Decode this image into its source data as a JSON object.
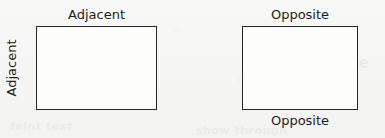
{
  "figure": {
    "background_color": "#f7f7f5",
    "stroke_color": "#262629",
    "fill_color": "#fdfdfc",
    "text_color": "#1d1d20",
    "shapes": [
      {
        "id": "rect-left",
        "type": "rectangle",
        "x": 36,
        "y": 26,
        "width": 121,
        "height": 84,
        "labels": {
          "top": "Adjacent",
          "left": "Adjacent"
        }
      },
      {
        "id": "rect-right",
        "type": "rectangle",
        "x": 242,
        "y": 26,
        "width": 116,
        "height": 84,
        "labels": {
          "top": "Opposite",
          "bottom": "Opposite"
        }
      }
    ]
  },
  "artifacts": {
    "bleed_through": [
      "scanned page",
      "reverse side",
      "faint text",
      "show through"
    ]
  }
}
